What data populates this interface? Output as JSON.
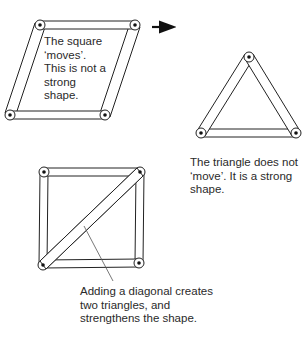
{
  "captions": {
    "square": [
      "The square",
      "‘moves’.",
      "This is not a",
      "strong",
      "shape."
    ],
    "triangle": [
      "The triangle does not",
      "‘move’. It is a strong",
      "shape."
    ],
    "diagonal": [
      "Adding a diagonal creates",
      "two triangles, and",
      "strengthens the shape."
    ]
  },
  "shapes": {
    "parallelogram": {
      "label": "square-frame-deformed",
      "pivots": [
        [
          40,
          25
        ],
        [
          135,
          25
        ],
        [
          105,
          115
        ],
        [
          10,
          115
        ]
      ]
    },
    "triangle": {
      "label": "triangle-frame",
      "pivots": [
        [
          249,
          57
        ],
        [
          201,
          133
        ],
        [
          296,
          133
        ]
      ]
    },
    "braced_square": {
      "label": "square-frame-with-diagonal",
      "pivots": [
        [
          44,
          172
        ],
        [
          140,
          172
        ],
        [
          139,
          263
        ],
        [
          43,
          265
        ]
      ]
    }
  },
  "colors": {
    "stroke": "#222222",
    "text": "#2a2a2a",
    "background": "#ffffff"
  }
}
